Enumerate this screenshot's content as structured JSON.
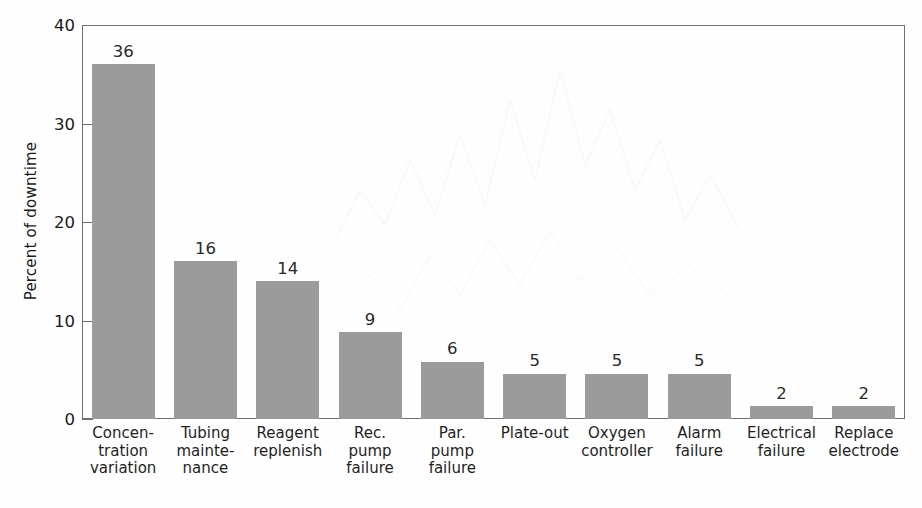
{
  "chart_data": {
    "type": "bar",
    "title": "",
    "xlabel": "",
    "ylabel": "Percent of downtime",
    "ylim": [
      0,
      40
    ],
    "yticks": [
      0,
      10,
      20,
      30,
      40
    ],
    "ytick_labels": [
      "0",
      "10",
      "20",
      "30",
      "40"
    ],
    "grid": false,
    "legend": false,
    "bar_color": "#9b9b9b",
    "frame_color": "#6f6f72",
    "value_labels_shown": true,
    "categories": [
      "Concentration variation",
      "Tubing maintenance",
      "Reagent replenish",
      "Rec. pump failure",
      "Par. pump failure",
      "Plate-out",
      "Oxygen controller",
      "Alarm failure",
      "Electrical failure",
      "Replace electrode"
    ],
    "category_lines": [
      [
        "Concen-",
        "tration",
        "variation"
      ],
      [
        "Tubing",
        "mainte-",
        "nance"
      ],
      [
        "Reagent",
        "replenish"
      ],
      [
        "Rec.",
        "pump",
        "failure"
      ],
      [
        "Par.",
        "pump",
        "failure"
      ],
      [
        "Plate-out"
      ],
      [
        "Oxygen",
        "controller"
      ],
      [
        "Alarm",
        "failure"
      ],
      [
        "Electrical",
        "failure"
      ],
      [
        "Replace",
        "electrode"
      ]
    ],
    "values": [
      36,
      16,
      14,
      9,
      6,
      5,
      5,
      5,
      2,
      2
    ],
    "value_label_text": [
      "36",
      "16",
      "14",
      "9",
      "6",
      "5",
      "5",
      "5",
      "2",
      "2"
    ],
    "plotted_heights": [
      36,
      16,
      14,
      8.8,
      5.8,
      4.6,
      4.6,
      4.6,
      1.3,
      1.3
    ]
  }
}
